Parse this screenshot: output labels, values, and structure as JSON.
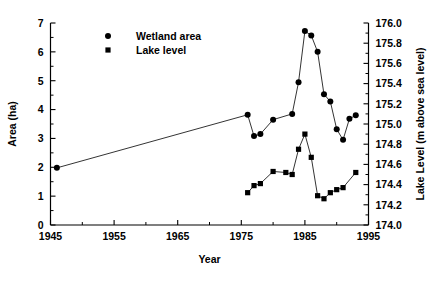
{
  "chart_data": {
    "type": "line",
    "title": "",
    "xlabel": "Year",
    "ylabel": "Area (ha)",
    "y2label": "Lake Level (m above sea level)",
    "xlim": [
      1945,
      1995
    ],
    "ylim": [
      0,
      7
    ],
    "y2lim": [
      174.0,
      176.0
    ],
    "xticks": [
      1945,
      1955,
      1965,
      1975,
      1985,
      1995
    ],
    "xtick_labels": [
      "1945",
      "1955",
      "1965",
      "1975",
      "1985",
      "1995"
    ],
    "xminor_ticks": [
      1950,
      1960,
      1970,
      1980,
      1990
    ],
    "yticks": [
      0,
      1,
      2,
      3,
      4,
      5,
      6,
      7
    ],
    "ytick_labels": [
      "0",
      "1",
      "2",
      "3",
      "4",
      "5",
      "6",
      "7"
    ],
    "y2ticks": [
      174.0,
      174.2,
      174.4,
      174.6,
      174.8,
      175.0,
      175.2,
      175.4,
      175.6,
      175.8,
      176.0
    ],
    "y2tick_labels": [
      "174.0",
      "174.2",
      "174.4",
      "174.6",
      "174.8",
      "175.0",
      "175.2",
      "175.4",
      "175.6",
      "175.8",
      "176.0"
    ],
    "grid": false,
    "legend_position": "upper-left-inside",
    "series": [
      {
        "name": "Wetland area",
        "marker": "circle",
        "axis": "left",
        "color": "#000000",
        "x": [
          1946,
          1976,
          1977,
          1978,
          1980,
          1983,
          1984,
          1985,
          1986,
          1987,
          1988,
          1989,
          1990,
          1991,
          1992,
          1993
        ],
        "values": [
          1.98,
          3.82,
          3.08,
          3.15,
          3.65,
          3.85,
          4.95,
          6.72,
          6.57,
          6.0,
          4.53,
          4.28,
          3.32,
          2.95,
          3.68,
          3.8
        ]
      },
      {
        "name": "Lake level",
        "marker": "square",
        "axis": "right",
        "color": "#000000",
        "x": [
          1976,
          1977,
          1978,
          1980,
          1982,
          1983,
          1984,
          1985,
          1986,
          1987,
          1988,
          1989,
          1990,
          1991,
          1993
        ],
        "values": [
          174.32,
          174.39,
          174.41,
          174.53,
          174.52,
          174.5,
          174.75,
          174.9,
          174.67,
          174.29,
          174.26,
          174.32,
          174.35,
          174.37,
          174.52
        ]
      }
    ],
    "legend": [
      {
        "label": "Wetland area",
        "marker": "circle"
      },
      {
        "label": "Lake level",
        "marker": "square"
      }
    ]
  }
}
